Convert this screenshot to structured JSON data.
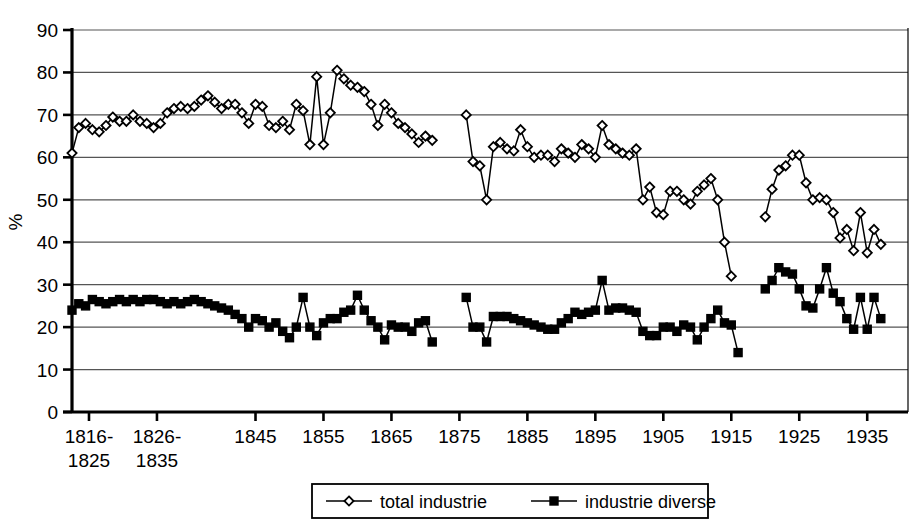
{
  "chart_data": {
    "type": "line",
    "title": "",
    "xlabel": "",
    "ylabel": "%",
    "ylim": [
      0,
      90
    ],
    "ytick_step": 10,
    "yticks": [
      0,
      10,
      20,
      30,
      40,
      50,
      60,
      70,
      80,
      90
    ],
    "grid": true,
    "grid_axis": "y",
    "legend_position": "bottom-center",
    "xtick_labels": [
      "1816-\n1825",
      "1826-\n1835",
      "1845",
      "1855",
      "1865",
      "1875",
      "1885",
      "1895",
      "1905",
      "1915",
      "1925",
      "1935"
    ],
    "xtick_values": [
      1820.5,
      1830.5,
      1845,
      1855,
      1865,
      1875,
      1885,
      1895,
      1905,
      1915,
      1925,
      1935
    ],
    "xlim": [
      1818,
      1941
    ],
    "series": [
      {
        "name": "total industrie",
        "marker": "open-diamond",
        "color": "#000000",
        "points": [
          [
            1818,
            61
          ],
          [
            1819,
            67
          ],
          [
            1820,
            68
          ],
          [
            1821,
            66.5
          ],
          [
            1822,
            66
          ],
          [
            1823,
            67.5
          ],
          [
            1824,
            69.5
          ],
          [
            1825,
            68.5
          ],
          [
            1826,
            68.5
          ],
          [
            1827,
            70
          ],
          [
            1828,
            68.5
          ],
          [
            1829,
            68
          ],
          [
            1830,
            67
          ],
          [
            1831,
            68
          ],
          [
            1832,
            70.5
          ],
          [
            1833,
            71.5
          ],
          [
            1834,
            72
          ],
          [
            1835,
            71.5
          ],
          [
            1836,
            72
          ],
          [
            1837,
            73.5
          ],
          [
            1838,
            74.5
          ],
          [
            1839,
            73
          ],
          [
            1840,
            71.5
          ],
          [
            1841,
            72.5
          ],
          [
            1842,
            72.5
          ],
          [
            1843,
            70.5
          ],
          [
            1844,
            68
          ],
          [
            1845,
            72.5
          ],
          [
            1846,
            72
          ],
          [
            1847,
            67.5
          ],
          [
            1848,
            67
          ],
          [
            1849,
            68.5
          ],
          [
            1850,
            66.5
          ],
          [
            1851,
            72.5
          ],
          [
            1852,
            71
          ],
          [
            1853,
            63
          ],
          [
            1854,
            79
          ],
          [
            1855,
            63
          ],
          [
            1856,
            70.5
          ],
          [
            1857,
            80.5
          ],
          [
            1858,
            78.5
          ],
          [
            1859,
            77
          ],
          [
            1860,
            76.5
          ],
          [
            1861,
            75.5
          ],
          [
            1862,
            72.5
          ],
          [
            1863,
            67.5
          ],
          [
            1864,
            72.5
          ],
          [
            1865,
            70.5
          ],
          [
            1866,
            68
          ],
          [
            1867,
            67
          ],
          [
            1868,
            65.5
          ],
          [
            1869,
            63.5
          ],
          [
            1870,
            65
          ],
          [
            1871,
            64
          ],
          [
            1876,
            70
          ],
          [
            1877,
            59
          ],
          [
            1878,
            58
          ],
          [
            1879,
            50
          ],
          [
            1880,
            62.5
          ],
          [
            1881,
            63.5
          ],
          [
            1882,
            62
          ],
          [
            1883,
            61.5
          ],
          [
            1884,
            66.5
          ],
          [
            1885,
            62.5
          ],
          [
            1886,
            60
          ],
          [
            1887,
            60.5
          ],
          [
            1888,
            60.5
          ],
          [
            1889,
            59
          ],
          [
            1890,
            62
          ],
          [
            1891,
            61
          ],
          [
            1892,
            60
          ],
          [
            1893,
            63
          ],
          [
            1894,
            62
          ],
          [
            1895,
            60
          ],
          [
            1896,
            67.5
          ],
          [
            1897,
            63
          ],
          [
            1898,
            62
          ],
          [
            1899,
            61
          ],
          [
            1900,
            60.5
          ],
          [
            1901,
            62
          ],
          [
            1902,
            50
          ],
          [
            1903,
            53
          ],
          [
            1904,
            47
          ],
          [
            1905,
            46.5
          ],
          [
            1906,
            52
          ],
          [
            1907,
            52
          ],
          [
            1908,
            50
          ],
          [
            1909,
            49
          ],
          [
            1910,
            52
          ],
          [
            1911,
            53.5
          ],
          [
            1912,
            55
          ],
          [
            1913,
            50
          ],
          [
            1914,
            40
          ],
          [
            1915,
            32
          ],
          [
            1920,
            46
          ],
          [
            1921,
            52.5
          ],
          [
            1922,
            57
          ],
          [
            1923,
            58
          ],
          [
            1924,
            60.5
          ],
          [
            1925,
            60.5
          ],
          [
            1926,
            54
          ],
          [
            1927,
            50
          ],
          [
            1928,
            50.5
          ],
          [
            1929,
            50
          ],
          [
            1930,
            47
          ],
          [
            1931,
            41
          ],
          [
            1932,
            43
          ],
          [
            1933,
            38
          ],
          [
            1934,
            47
          ],
          [
            1935,
            37.5
          ],
          [
            1936,
            43
          ],
          [
            1937,
            39.5
          ]
        ]
      },
      {
        "name": "industrie diverse",
        "marker": "filled-square",
        "color": "#000000",
        "points": [
          [
            1818,
            24
          ],
          [
            1819,
            25.5
          ],
          [
            1820,
            25
          ],
          [
            1821,
            26.5
          ],
          [
            1822,
            26
          ],
          [
            1823,
            25.5
          ],
          [
            1824,
            26
          ],
          [
            1825,
            26.5
          ],
          [
            1826,
            26
          ],
          [
            1827,
            26.5
          ],
          [
            1828,
            26
          ],
          [
            1829,
            26.5
          ],
          [
            1830,
            26.5
          ],
          [
            1831,
            26
          ],
          [
            1832,
            25.5
          ],
          [
            1833,
            26
          ],
          [
            1834,
            25.5
          ],
          [
            1835,
            26
          ],
          [
            1836,
            26.5
          ],
          [
            1837,
            26
          ],
          [
            1838,
            25.5
          ],
          [
            1839,
            25
          ],
          [
            1840,
            24.5
          ],
          [
            1841,
            24
          ],
          [
            1842,
            23
          ],
          [
            1843,
            22
          ],
          [
            1844,
            20
          ],
          [
            1845,
            22
          ],
          [
            1846,
            21.5
          ],
          [
            1847,
            20
          ],
          [
            1848,
            21
          ],
          [
            1849,
            19
          ],
          [
            1850,
            17.5
          ],
          [
            1851,
            20
          ],
          [
            1852,
            27
          ],
          [
            1853,
            20
          ],
          [
            1854,
            18
          ],
          [
            1855,
            21
          ],
          [
            1856,
            22
          ],
          [
            1857,
            22
          ],
          [
            1858,
            23.5
          ],
          [
            1859,
            24
          ],
          [
            1860,
            27.5
          ],
          [
            1861,
            24
          ],
          [
            1862,
            21.5
          ],
          [
            1863,
            20
          ],
          [
            1864,
            17
          ],
          [
            1865,
            20.5
          ],
          [
            1866,
            20
          ],
          [
            1867,
            20
          ],
          [
            1868,
            19
          ],
          [
            1869,
            21
          ],
          [
            1870,
            21.5
          ],
          [
            1871,
            16.5
          ],
          [
            1876,
            27
          ],
          [
            1877,
            20
          ],
          [
            1878,
            20
          ],
          [
            1879,
            16.5
          ],
          [
            1880,
            22.5
          ],
          [
            1881,
            22.5
          ],
          [
            1882,
            22.5
          ],
          [
            1883,
            22
          ],
          [
            1884,
            21.5
          ],
          [
            1885,
            21
          ],
          [
            1886,
            20.5
          ],
          [
            1887,
            20
          ],
          [
            1888,
            19.5
          ],
          [
            1889,
            19.5
          ],
          [
            1890,
            21
          ],
          [
            1891,
            22
          ],
          [
            1892,
            23.5
          ],
          [
            1893,
            23
          ],
          [
            1894,
            23.5
          ],
          [
            1895,
            24
          ],
          [
            1896,
            31
          ],
          [
            1897,
            24
          ],
          [
            1898,
            24.5
          ],
          [
            1899,
            24.5
          ],
          [
            1900,
            24
          ],
          [
            1901,
            23.5
          ],
          [
            1902,
            19
          ],
          [
            1903,
            18
          ],
          [
            1904,
            18
          ],
          [
            1905,
            20
          ],
          [
            1906,
            20
          ],
          [
            1907,
            19
          ],
          [
            1908,
            20.5
          ],
          [
            1909,
            20
          ],
          [
            1910,
            17
          ],
          [
            1911,
            20
          ],
          [
            1912,
            22
          ],
          [
            1913,
            24
          ],
          [
            1914,
            21
          ],
          [
            1915,
            20.5
          ],
          [
            1916,
            14
          ],
          [
            1920,
            29
          ],
          [
            1921,
            31
          ],
          [
            1922,
            34
          ],
          [
            1923,
            33
          ],
          [
            1924,
            32.5
          ],
          [
            1925,
            29
          ],
          [
            1926,
            25
          ],
          [
            1927,
            24.5
          ],
          [
            1928,
            29
          ],
          [
            1929,
            34
          ],
          [
            1930,
            28
          ],
          [
            1931,
            26
          ],
          [
            1932,
            22
          ],
          [
            1933,
            19.5
          ],
          [
            1934,
            27
          ],
          [
            1935,
            19.5
          ],
          [
            1936,
            27
          ],
          [
            1937,
            22
          ]
        ]
      }
    ]
  },
  "legend": {
    "entries": [
      {
        "label": "total industrie",
        "marker": "open-diamond"
      },
      {
        "label": "industrie diverse",
        "marker": "filled-square"
      }
    ]
  },
  "axis": {
    "y_label": "%"
  }
}
